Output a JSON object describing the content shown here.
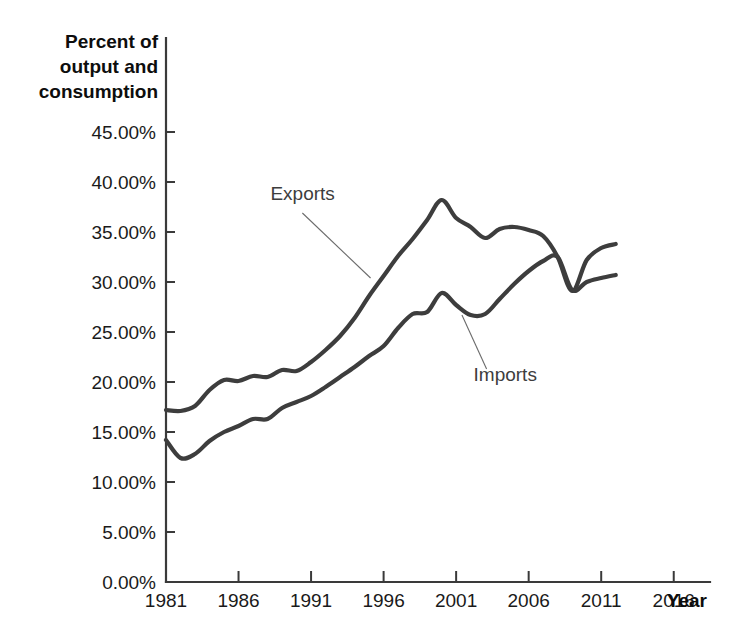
{
  "chart_data": {
    "type": "line",
    "title": "",
    "ylabel": "Percent of output and consumption",
    "ylabel_lines": [
      "Percent of",
      "output and",
      "consumption"
    ],
    "xlabel": "Year",
    "xlim": [
      1981,
      2018.5
    ],
    "ylim": [
      0,
      47
    ],
    "grid": false,
    "legend_position": "inline-annotations",
    "x_ticks": [
      1981,
      1986,
      1991,
      1996,
      2001,
      2006,
      2011,
      2016
    ],
    "x_tick_labels": [
      "1981",
      "1986",
      "1991",
      "1996",
      "2001",
      "2006",
      "2011",
      "2016"
    ],
    "y_ticks": [
      0,
      5,
      10,
      15,
      20,
      25,
      30,
      35,
      40,
      45
    ],
    "y_tick_labels": [
      "0.00%",
      "5.00%",
      "10.00%",
      "15.00%",
      "20.00%",
      "25.00%",
      "30.00%",
      "35.00%",
      "40.00%",
      "45.00%"
    ],
    "x": [
      1981,
      1982,
      1983,
      1984,
      1985,
      1986,
      1987,
      1988,
      1989,
      1990,
      1991,
      1992,
      1993,
      1994,
      1995,
      1996,
      1997,
      1998,
      1999,
      2000,
      2001,
      2002,
      2003,
      2004,
      2005,
      2006,
      2007,
      2008,
      2009,
      2010,
      2011,
      2012
    ],
    "series": [
      {
        "name": "Exports",
        "color": "#3d3d3d",
        "values": [
          17.2,
          17.1,
          17.6,
          19.2,
          20.2,
          20.1,
          20.6,
          20.5,
          21.2,
          21.1,
          22.0,
          23.2,
          24.6,
          26.4,
          28.6,
          30.6,
          32.6,
          34.3,
          36.2,
          38.2,
          36.4,
          35.5,
          34.4,
          35.3,
          35.5,
          35.2,
          34.6,
          32.5,
          29.1,
          32.2,
          33.4,
          33.8
        ]
      },
      {
        "name": "Imports",
        "color": "#3d3d3d",
        "values": [
          14.2,
          12.4,
          12.8,
          14.1,
          15.0,
          15.6,
          16.3,
          16.3,
          17.4,
          18.0,
          18.6,
          19.5,
          20.5,
          21.5,
          22.6,
          23.6,
          25.4,
          26.8,
          27.0,
          28.9,
          27.7,
          26.7,
          26.8,
          28.3,
          29.8,
          31.1,
          32.1,
          32.5,
          29.2,
          30.0,
          30.4,
          30.7
        ]
      }
    ],
    "annotations": [
      {
        "label": "Exports",
        "text_x": 1988.2,
        "text_y": 38.2,
        "leader_from_x": 1990.4,
        "leader_from_y": 36.9,
        "leader_to_x": 1995.1,
        "leader_to_y": 30.4
      },
      {
        "label": "Imports",
        "text_x": 2002.2,
        "text_y": 20.1,
        "leader_from_x": 2003.1,
        "leader_from_y": 21.3,
        "leader_to_x": 2001.4,
        "leader_to_y": 26.7
      }
    ]
  }
}
